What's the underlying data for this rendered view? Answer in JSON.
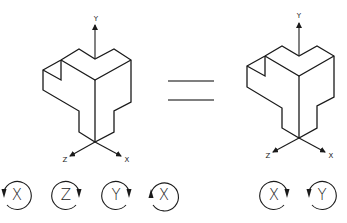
{
  "figures": [
    {
      "id": "original",
      "axes": {
        "y": "Y",
        "z": "Z",
        "x": "X"
      }
    },
    {
      "id": "equivalent",
      "axes": {
        "y": "Y",
        "z": "Z",
        "x": "X"
      }
    }
  ],
  "relation_symbol": "=",
  "left_rotations": [
    {
      "axis": "X",
      "direction": "open-left-arrow-down"
    },
    {
      "axis": "Z",
      "direction": "open-right-arrow-down"
    },
    {
      "axis": "Y",
      "direction": "open-right-arrow-down"
    },
    {
      "axis": "X",
      "direction": "open-left-arrow-up"
    }
  ],
  "right_rotations": [
    {
      "axis": "X",
      "direction": "open-right-arrow-down"
    },
    {
      "axis": "Y",
      "direction": "open-left-arrow-down"
    }
  ],
  "colors": {
    "line": "#1a1a1a",
    "background": "#ffffff"
  }
}
